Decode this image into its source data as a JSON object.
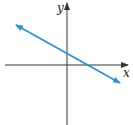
{
  "figure": {
    "type": "coordinate-plane-line",
    "x_axis_label": "x",
    "y_axis_label": "y",
    "line": {
      "description": "line with negative slope, positive y-intercept, positive x-intercept, arrows on both ends",
      "color": "#2e8fca"
    },
    "axis_color": "#333333"
  }
}
